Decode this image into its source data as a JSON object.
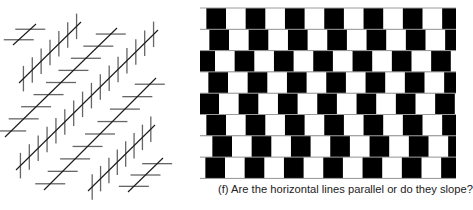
{
  "colors": {
    "diagonal": "#1a1a1a",
    "hatch": "#666666",
    "tile_dark": "#000000",
    "tile_light": "#ffffff",
    "mortar": "#9a9a9a",
    "caption": "#222222"
  },
  "zollner": {
    "name": "zollner-illusion",
    "diagonals": [
      {
        "x1": 13,
        "y1": 45,
        "x2": 36,
        "y2": 24,
        "hatch": "horizontal",
        "count": 2
      },
      {
        "x1": 19,
        "y1": 83,
        "x2": 81,
        "y2": 22,
        "hatch": "vertical",
        "count": 7
      },
      {
        "x1": 5,
        "y1": 137,
        "x2": 117,
        "y2": 28,
        "hatch": "horizontal",
        "count": 9
      },
      {
        "x1": 16,
        "y1": 170,
        "x2": 158,
        "y2": 30,
        "hatch": "vertical",
        "count": 16
      },
      {
        "x1": 44,
        "y1": 190,
        "x2": 156,
        "y2": 78,
        "hatch": "horizontal",
        "count": 9
      },
      {
        "x1": 88,
        "y1": 191,
        "x2": 155,
        "y2": 125,
        "hatch": "vertical",
        "count": 8
      },
      {
        "x1": 128,
        "y1": 192,
        "x2": 163,
        "y2": 158,
        "hatch": "horizontal",
        "count": 3
      }
    ],
    "hatch_length": 30
  },
  "cafe_wall": {
    "name": "cafe-wall-illusion",
    "top": 8,
    "row_height": 21.3,
    "tile_width": 19.65,
    "width": 256,
    "row_white_starts": [
      26,
      29,
      15,
      28,
      19,
      26,
      32,
      25
    ]
  },
  "caption": {
    "text": "(f) Are the horizontal lines parallel or do they slope?"
  }
}
